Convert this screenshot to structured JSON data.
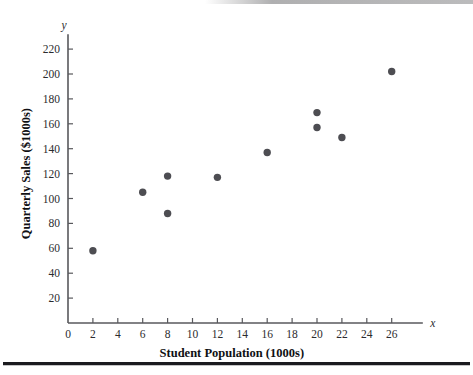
{
  "chart_data": {
    "type": "scatter",
    "title": "",
    "xlabel": "Student Population (1000s)",
    "ylabel": "Quarterly Sales ($1000s)",
    "x_axis_variable": "x",
    "y_axis_variable": "y",
    "xlim": [
      0,
      28.5
    ],
    "ylim": [
      0,
      232
    ],
    "xticks": [
      0,
      2,
      4,
      6,
      8,
      10,
      12,
      14,
      16,
      18,
      20,
      22,
      24,
      26
    ],
    "yticks": [
      20,
      40,
      60,
      80,
      100,
      120,
      140,
      160,
      180,
      200,
      220
    ],
    "xticklabels": [
      "0",
      "2",
      "4",
      "6",
      "8",
      "10",
      "12",
      "14",
      "16",
      "18",
      "20",
      "22",
      "24",
      "26"
    ],
    "yticklabels": [
      "20",
      "40",
      "60",
      "80",
      "100",
      "120",
      "140",
      "160",
      "180",
      "200",
      "220"
    ],
    "grid": false,
    "legend": false,
    "marker_color": "#4d4d52",
    "axis_color": "#58585c",
    "points": [
      {
        "x": 2,
        "y": 58
      },
      {
        "x": 6,
        "y": 105
      },
      {
        "x": 8,
        "y": 88
      },
      {
        "x": 8,
        "y": 118
      },
      {
        "x": 12,
        "y": 117
      },
      {
        "x": 16,
        "y": 137
      },
      {
        "x": 20,
        "y": 157
      },
      {
        "x": 20,
        "y": 169
      },
      {
        "x": 22,
        "y": 149
      },
      {
        "x": 26,
        "y": 202
      }
    ]
  },
  "figure": {
    "x_axis_title": "Student Population (1000s)",
    "y_axis_title": "Quarterly Sales ($1000s)",
    "x_symbol": "x",
    "y_symbol": "y"
  }
}
